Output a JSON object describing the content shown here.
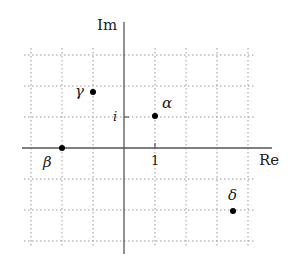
{
  "diagram": {
    "axes": {
      "real_label": "Re",
      "imag_label": "Im",
      "real_tick_label": "1",
      "imag_tick_label": "i"
    },
    "grid": {
      "x_min": -3,
      "x_max": 4,
      "y_min": -3,
      "y_max": 3,
      "style": "dotted"
    },
    "points": [
      {
        "name": "alpha",
        "label": "α",
        "re": 1,
        "im": 1
      },
      {
        "name": "beta",
        "label": "β",
        "re": -2,
        "im": 0
      },
      {
        "name": "gamma",
        "label": "γ",
        "re": -1,
        "im": 1.8
      },
      {
        "name": "delta",
        "label": "δ",
        "re": 3.5,
        "im": -2
      }
    ]
  }
}
